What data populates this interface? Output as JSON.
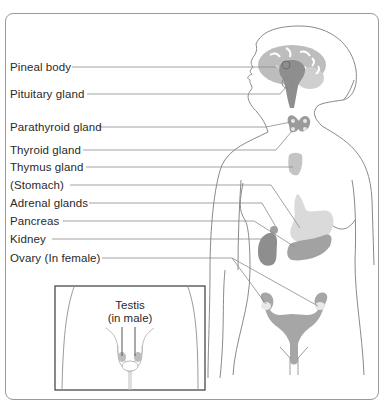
{
  "diagram": {
    "colors": {
      "outline": "#8a8a8a",
      "leader_line": "#8c8c8c",
      "organ_dark": "#8e8e8e",
      "organ_mid": "#a6a6a6",
      "organ_light": "#cfcfcf",
      "brain": "#bdbdbd",
      "text": "#2a2a2a"
    },
    "labels": [
      {
        "text": "Pineal body",
        "target": "pineal-body"
      },
      {
        "text": "Pituitary gland",
        "target": "pituitary-gland"
      },
      {
        "text": "Parathyroid gland",
        "target": "parathyroid-gland"
      },
      {
        "text": "Thyroid gland",
        "target": "thyroid-gland"
      },
      {
        "text": "Thymus gland",
        "target": "thymus-gland"
      },
      {
        "text": "(Stomach)",
        "target": "stomach"
      },
      {
        "text": "Adrenal glands",
        "target": "adrenal-glands"
      },
      {
        "text": "Pancreas",
        "target": "pancreas"
      },
      {
        "text": "Kidney",
        "target": "kidney"
      },
      {
        "text": "Ovary (In female)",
        "target": "ovary"
      }
    ],
    "inset": {
      "label_line1": "Testis",
      "label_line2": "(in male)"
    }
  }
}
